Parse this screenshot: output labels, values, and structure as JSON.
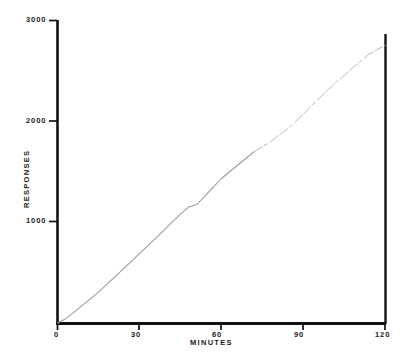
{
  "chart_data": {
    "type": "line",
    "title": "",
    "subtitle": "",
    "xlabel": "MINUTES",
    "ylabel": "RESPONSES",
    "xlim": [
      0,
      120
    ],
    "ylim": [
      0,
      3000
    ],
    "grid": false,
    "legend": null,
    "x_ticks": [
      0,
      30,
      60,
      90,
      120
    ],
    "x_tick_labels": [
      "0",
      "30",
      "60",
      "90",
      "120"
    ],
    "y_ticks": [
      1000,
      2000,
      3000
    ],
    "y_tick_labels": [
      "1000",
      "2000",
      "3000"
    ],
    "series": [
      {
        "name": "cumulative responses",
        "style": "thin gray cumulative record, fading toward upper right",
        "color": "#9a9a9a",
        "x": [
          0,
          3,
          6,
          9,
          12,
          15,
          18,
          21,
          24,
          27,
          30,
          33,
          36,
          39,
          42,
          45,
          48,
          51,
          54,
          57,
          60,
          63,
          66,
          69,
          72,
          75,
          78,
          81,
          84,
          87,
          90,
          93,
          96,
          99,
          102,
          105,
          108,
          111,
          114,
          117,
          120
        ],
        "y": [
          0,
          45,
          110,
          180,
          250,
          320,
          400,
          480,
          560,
          640,
          720,
          800,
          880,
          965,
          1050,
          1130,
          1205,
          1230,
          1320,
          1410,
          1500,
          1570,
          1640,
          1710,
          1780,
          1830,
          1880,
          1950,
          2010,
          2090,
          2170,
          2260,
          2340,
          2420,
          2500,
          2570,
          2650,
          2720,
          2790,
          2840,
          2880
        ]
      }
    ],
    "annotations": []
  },
  "axes": {
    "y_axis_label": "RESPONSES",
    "x_axis_label": "MINUTES",
    "y_labels": {
      "t3000": "3000",
      "t2000": "2000",
      "t1000": "1000"
    },
    "x_labels": {
      "t0": "0",
      "t30": "30",
      "t60": "60",
      "t90": "90",
      "t120": "120"
    }
  },
  "colors": {
    "axis": "#111111",
    "curve": "#9a9a9a",
    "background": "#ffffff",
    "text": "#1a1a1a"
  }
}
